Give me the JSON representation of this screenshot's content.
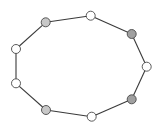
{
  "diagram": {
    "type": "cycle-graph",
    "node_radius": 4.5,
    "colors": {
      "edge": "#3a3a3a",
      "node_stroke": "#4a4a4a",
      "white": "#ffffff",
      "light_gray": "#c8c8c8",
      "dark_gray": "#a0a0a0"
    },
    "nodes": [
      {
        "id": "n1",
        "x": 45.7,
        "y": 22.3,
        "fill": "#c8c8c8"
      },
      {
        "id": "n2",
        "x": 90.7,
        "y": 15.7,
        "fill": "#ffffff"
      },
      {
        "id": "n3",
        "x": 131.7,
        "y": 34.0,
        "fill": "#a0a0a0"
      },
      {
        "id": "n4",
        "x": 146.7,
        "y": 66.7,
        "fill": "#ffffff"
      },
      {
        "id": "n5",
        "x": 131.7,
        "y": 99.3,
        "fill": "#a0a0a0"
      },
      {
        "id": "n6",
        "x": 91.7,
        "y": 116.7,
        "fill": "#ffffff"
      },
      {
        "id": "n7",
        "x": 46.0,
        "y": 110.0,
        "fill": "#c8c8c8"
      },
      {
        "id": "n8",
        "x": 16.0,
        "y": 83.3,
        "fill": "#ffffff"
      },
      {
        "id": "n9",
        "x": 16.0,
        "y": 49.0,
        "fill": "#ffffff"
      }
    ],
    "edges": [
      [
        "n1",
        "n2"
      ],
      [
        "n2",
        "n3"
      ],
      [
        "n3",
        "n4"
      ],
      [
        "n4",
        "n5"
      ],
      [
        "n5",
        "n6"
      ],
      [
        "n6",
        "n7"
      ],
      [
        "n7",
        "n8"
      ],
      [
        "n8",
        "n9"
      ],
      [
        "n9",
        "n1"
      ]
    ]
  }
}
